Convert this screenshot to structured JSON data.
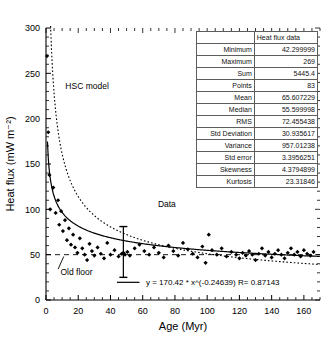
{
  "chart_data": {
    "type": "scatter",
    "title": "",
    "xlabel": "Age (Myr)",
    "ylabel": "Heat flux (mW m⁻²)",
    "xlim": [
      0,
      170
    ],
    "ylim": [
      0,
      300
    ],
    "xticks": [
      0,
      20,
      40,
      60,
      80,
      100,
      120,
      140,
      160
    ],
    "yticks": [
      0,
      50,
      100,
      150,
      200,
      250,
      300
    ],
    "grid": false,
    "legend_position": "none",
    "annotations": [
      {
        "name": "hsc-model-label",
        "text": "HSC model",
        "x": 12,
        "y": 233
      },
      {
        "name": "data-label",
        "text": "Data",
        "x": 75,
        "y": 103
      },
      {
        "name": "old-floor-label",
        "text": "Old floor",
        "x": 9,
        "y": 28
      },
      {
        "name": "fit-equation",
        "text": "y = 170.42 * x^(-0.24639)   R= 0.87143",
        "x": 62,
        "y": 16
      }
    ],
    "series": [
      {
        "name": "Data",
        "style": "scatter",
        "marker": "diamond",
        "color": "#000000",
        "points": [
          [
            0.6,
            269
          ],
          [
            1.4,
            185
          ],
          [
            2.1,
            138
          ],
          [
            2.6,
            100
          ],
          [
            4.5,
            124
          ],
          [
            6.0,
            96
          ],
          [
            7.5,
            110
          ],
          [
            8.2,
            83
          ],
          [
            9.4,
            98
          ],
          [
            10.5,
            76
          ],
          [
            11.8,
            88
          ],
          [
            13.0,
            66
          ],
          [
            14.2,
            79
          ],
          [
            15.5,
            61
          ],
          [
            16.8,
            72
          ],
          [
            18.0,
            58
          ],
          [
            19.5,
            52
          ],
          [
            21.0,
            68
          ],
          [
            22.5,
            57
          ],
          [
            24.0,
            50
          ],
          [
            25.5,
            44
          ],
          [
            27.0,
            62
          ],
          [
            28.5,
            54
          ],
          [
            30.0,
            49
          ],
          [
            32.0,
            58
          ],
          [
            34.0,
            51
          ],
          [
            36.0,
            46
          ],
          [
            38.0,
            63
          ],
          [
            40.0,
            50
          ],
          [
            42.5,
            55
          ],
          [
            45.0,
            48
          ],
          [
            47.0,
            51
          ],
          [
            48.0,
            52
          ],
          [
            49.0,
            50
          ],
          [
            50.5,
            53
          ],
          [
            52.0,
            49
          ],
          [
            55.0,
            57
          ],
          [
            58.0,
            61
          ],
          [
            61.0,
            54
          ],
          [
            64.0,
            50
          ],
          [
            67.0,
            58
          ],
          [
            70.0,
            52
          ],
          [
            73.0,
            47
          ],
          [
            76.0,
            60
          ],
          [
            79.0,
            54
          ],
          [
            82.0,
            49
          ],
          [
            85.0,
            63
          ],
          [
            88.0,
            56
          ],
          [
            91.0,
            51
          ],
          [
            94.0,
            47
          ],
          [
            97.0,
            59
          ],
          [
            99.0,
            41
          ],
          [
            101.0,
            72
          ],
          [
            103.0,
            55
          ],
          [
            106.0,
            50
          ],
          [
            109.0,
            57
          ],
          [
            112.0,
            48
          ],
          [
            115.0,
            53
          ],
          [
            118.0,
            50
          ],
          [
            120.0,
            46
          ],
          [
            122.0,
            52
          ],
          [
            124.0,
            49
          ],
          [
            126.0,
            54
          ],
          [
            128.0,
            50
          ],
          [
            130.0,
            44
          ],
          [
            132.0,
            51
          ],
          [
            134.0,
            57
          ],
          [
            136.0,
            49
          ],
          [
            138.0,
            53
          ],
          [
            140.0,
            47
          ],
          [
            142.0,
            51
          ],
          [
            144.0,
            55
          ],
          [
            146.0,
            50
          ],
          [
            148.0,
            46
          ],
          [
            150.0,
            52
          ],
          [
            152.0,
            57
          ],
          [
            154.0,
            50
          ],
          [
            156.0,
            53
          ],
          [
            158.0,
            48
          ],
          [
            160.0,
            55
          ],
          [
            162.0,
            51
          ],
          [
            164.0,
            49
          ],
          [
            166.0,
            53
          ]
        ]
      },
      {
        "name": "Power-law fit",
        "style": "line-solid",
        "color": "#000000",
        "equation": "y = 170.42 * x^(-0.24639)",
        "r": 0.87143,
        "coefficient": 170.42,
        "exponent": -0.24639
      },
      {
        "name": "HSC model",
        "style": "line-dotted",
        "color": "#000000",
        "equation": "y = 510 / sqrt(x)"
      },
      {
        "name": "Old floor",
        "style": "line-dashed",
        "color": "#000000",
        "value": 50
      }
    ],
    "error_bar": {
      "name": "error-bar",
      "x": 48,
      "y": 50,
      "low": 25,
      "high": 81
    }
  },
  "stats_table": {
    "header_blank": "",
    "header": "Heat flux data",
    "rows": [
      {
        "label": "Minimum",
        "value": "42.299999"
      },
      {
        "label": "Maximum",
        "value": "269"
      },
      {
        "label": "Sum",
        "value": "5445.4"
      },
      {
        "label": "Points",
        "value": "83"
      },
      {
        "label": "Mean",
        "value": "65.607229"
      },
      {
        "label": "Median",
        "value": "55.599998"
      },
      {
        "label": "RMS",
        "value": "72.455438"
      },
      {
        "label": "Std Deviation",
        "value": "30.935617"
      },
      {
        "label": "Variance",
        "value": "957.01238"
      },
      {
        "label": "Std error",
        "value": "3.3956251"
      },
      {
        "label": "Skewness",
        "value": "4.3794899"
      },
      {
        "label": "Kurtosis",
        "value": "23.31846"
      }
    ]
  }
}
